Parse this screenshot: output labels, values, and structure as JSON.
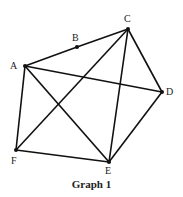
{
  "title": "Graph 1",
  "vertices": [
    {
      "id": "A",
      "x": 25,
      "y": 66,
      "lx": 10,
      "ly": 61
    },
    {
      "id": "B",
      "x": 77,
      "y": 47,
      "lx": 72,
      "ly": 33
    },
    {
      "id": "C",
      "x": 128,
      "y": 29,
      "lx": 124,
      "ly": 14
    },
    {
      "id": "D",
      "x": 162,
      "y": 92,
      "lx": 166,
      "ly": 87
    },
    {
      "id": "E",
      "x": 109,
      "y": 162,
      "lx": 105,
      "ly": 166
    },
    {
      "id": "F",
      "x": 16,
      "y": 150,
      "lx": 11,
      "ly": 156
    }
  ],
  "edges": [
    [
      "A",
      "B"
    ],
    [
      "B",
      "C"
    ],
    [
      "A",
      "D"
    ],
    [
      "A",
      "E"
    ],
    [
      "A",
      "F"
    ],
    [
      "C",
      "D"
    ],
    [
      "C",
      "E"
    ],
    [
      "C",
      "F"
    ],
    [
      "D",
      "E"
    ],
    [
      "F",
      "E"
    ]
  ],
  "colors": {
    "line": "#111111",
    "vertex": "#111111"
  }
}
